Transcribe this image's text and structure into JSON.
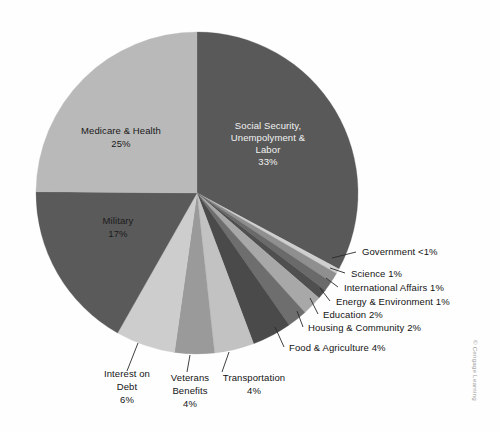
{
  "figure": {
    "credit": "© Cengage Learning",
    "background_color": "#fefefe"
  },
  "chart_data": {
    "type": "pie",
    "title": "",
    "subtitle": "",
    "xlabel": "",
    "ylabel": "",
    "legend_position": "none",
    "grid": false,
    "start_angle_deg": 0,
    "direction": "clockwise",
    "units": "percent of federal budget",
    "categories": [
      "Social Security, Unempolyment & Labor",
      "Government",
      "Science",
      "International Affairs",
      "Energy & Environment",
      "Education",
      "Housing & Community",
      "Food & Agriculture",
      "Transportation",
      "Veterans Benefits",
      "Interest on Debt",
      "Military",
      "Medicare & Health"
    ],
    "values": [
      33,
      0.5,
      1,
      1,
      1,
      2,
      2,
      4,
      4,
      4,
      6,
      17,
      25
    ],
    "value_labels": [
      "33%",
      "<1%",
      "1%",
      "1%",
      "1%",
      "2%",
      "2%",
      "4%",
      "4%",
      "4%",
      "6%",
      "17%",
      "25%"
    ],
    "colors": [
      "#595959",
      "#cfcfcf",
      "#8f8f8f",
      "#6a6a6a",
      "#4f4f4f",
      "#a8a8a8",
      "#6e6e6e",
      "#4a4a4a",
      "#c2c2c2",
      "#9a9a9a",
      "#cdcdcd",
      "#5a5a5a",
      "#b9b9b9"
    ],
    "slices": [
      {
        "name": "Social Security, Unempolyment & Labor",
        "value": 33,
        "value_label": "33%",
        "color": "#595959",
        "label_style": "inside-light",
        "label_lines": [
          "Social Security,",
          "Unempolyment &",
          "Labor",
          "33%"
        ]
      },
      {
        "name": "Government",
        "value": 0.5,
        "value_label": "<1%",
        "color": "#cfcfcf",
        "label_style": "callout",
        "callout_text": "Government <1%"
      },
      {
        "name": "Science",
        "value": 1,
        "value_label": "1%",
        "color": "#8f8f8f",
        "label_style": "callout",
        "callout_text": "Science 1%"
      },
      {
        "name": "International Affairs",
        "value": 1,
        "value_label": "1%",
        "color": "#6a6a6a",
        "label_style": "callout",
        "callout_text": "International Affairs 1%"
      },
      {
        "name": "Energy & Environment",
        "value": 1,
        "value_label": "1%",
        "color": "#4f4f4f",
        "label_style": "callout",
        "callout_text": "Energy & Environment 1%"
      },
      {
        "name": "Education",
        "value": 2,
        "value_label": "2%",
        "color": "#a8a8a8",
        "label_style": "callout",
        "callout_text": "Education 2%"
      },
      {
        "name": "Housing & Community",
        "value": 2,
        "value_label": "2%",
        "color": "#6e6e6e",
        "label_style": "callout",
        "callout_text": "Housing & Community 2%"
      },
      {
        "name": "Food & Agriculture",
        "value": 4,
        "value_label": "4%",
        "color": "#4a4a4a",
        "label_style": "callout",
        "callout_text": "Food & Agriculture 4%"
      },
      {
        "name": "Transportation",
        "value": 4,
        "value_label": "4%",
        "color": "#c2c2c2",
        "label_style": "callout-below",
        "label_lines": [
          "Transportation",
          "4%"
        ]
      },
      {
        "name": "Veterans Benefits",
        "value": 4,
        "value_label": "4%",
        "color": "#9a9a9a",
        "label_style": "callout-below",
        "label_lines": [
          "Veterans",
          "Benefits",
          "4%"
        ]
      },
      {
        "name": "Interest on Debt",
        "value": 6,
        "value_label": "6%",
        "color": "#cdcdcd",
        "label_style": "callout-below",
        "label_lines": [
          "Interest on",
          "Debt",
          "6%"
        ]
      },
      {
        "name": "Military",
        "value": 17,
        "value_label": "17%",
        "color": "#5a5a5a",
        "label_style": "inside-dark",
        "label_lines": [
          "Military",
          "17%"
        ]
      },
      {
        "name": "Medicare & Health",
        "value": 25,
        "value_label": "25%",
        "color": "#b9b9b9",
        "label_style": "inside-dark",
        "label_lines": [
          "Medicare & Health",
          "25%"
        ]
      }
    ]
  },
  "labels": {
    "social_security": {
      "l1": "Social Security,",
      "l2": "Unempolyment &",
      "l3": "Labor",
      "l4": "33%"
    },
    "medicare": {
      "l1": "Medicare & Health",
      "l2": "25%"
    },
    "military": {
      "l1": "Military",
      "l2": "17%"
    },
    "interest": {
      "l1": "Interest on",
      "l2": "Debt",
      "l3": "6%"
    },
    "veterans": {
      "l1": "Veterans",
      "l2": "Benefits",
      "l3": "4%"
    },
    "transportation": {
      "l1": "Transportation",
      "l2": "4%"
    },
    "government": "Government <1%",
    "science": "Science 1%",
    "international": "International Affairs 1%",
    "energy": "Energy & Environment 1%",
    "education": "Education 2%",
    "housing": "Housing & Community 2%",
    "food": "Food & Agriculture 4%"
  }
}
